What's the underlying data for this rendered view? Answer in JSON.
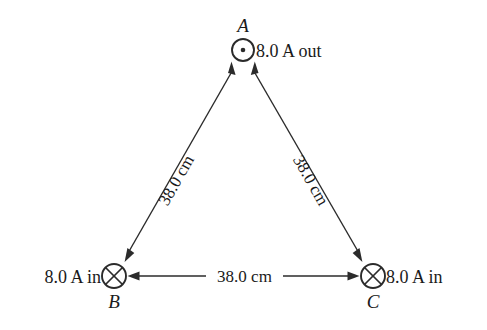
{
  "figure": {
    "title_text": "",
    "background_color": "#ffffff",
    "stroke_color": "#2b2b2b"
  },
  "vertices": [
    {
      "id": "A",
      "label": "A",
      "current_label": "8.0 A out",
      "direction": "out-of-page",
      "marker": "dot-icon",
      "cx": 243,
      "cy": 50,
      "r": 11
    },
    {
      "id": "B",
      "label": "B",
      "current_label": "8.0 A in",
      "direction": "into-page",
      "marker": "cross-icon",
      "cx": 114,
      "cy": 276,
      "r": 12
    },
    {
      "id": "C",
      "label": "C",
      "current_label": "8.0 A in",
      "direction": "into-page",
      "marker": "cross-icon",
      "cx": 373,
      "cy": 276,
      "r": 12
    }
  ],
  "edges": [
    {
      "id": "AB",
      "from": "A",
      "to": "B",
      "length_label": "38.0 cm",
      "label_rotation_deg": 60
    },
    {
      "id": "AC",
      "from": "A",
      "to": "C",
      "length_label": "38.0 cm",
      "label_rotation_deg": -60
    },
    {
      "id": "BC",
      "from": "B",
      "to": "C",
      "length_label": "38.0 cm",
      "label_rotation_deg": 0
    }
  ]
}
